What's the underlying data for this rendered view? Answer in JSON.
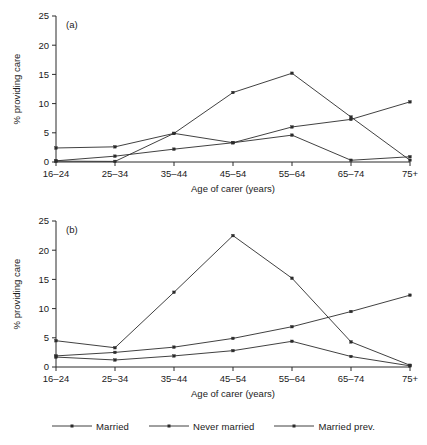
{
  "figure": {
    "panels": [
      "(a)",
      "(b)"
    ],
    "xlabel": "Age of carer (years)",
    "ylabel": "% providing care",
    "categories": [
      "16–24",
      "25–34",
      "35–44",
      "45–54",
      "55–64",
      "65–74",
      "75+"
    ],
    "yticks": [
      "0",
      "5",
      "10",
      "15",
      "20",
      "25"
    ]
  },
  "legend": {
    "position": "bottom-center",
    "items": [
      {
        "label": "Married",
        "marker": "line-with-dot-marker"
      },
      {
        "label": "Never married",
        "marker": "line-with-dot-marker"
      },
      {
        "label": "Married prev.",
        "marker": "line-with-dot-marker"
      }
    ]
  },
  "chart_data": [
    {
      "type": "line",
      "title": "(a)",
      "xlabel": "Age of carer (years)",
      "ylabel": "% providing care",
      "categories": [
        "16–24",
        "25–34",
        "35–44",
        "45–54",
        "55–64",
        "65–74",
        "75+"
      ],
      "ylim": [
        0,
        25
      ],
      "yticks": [
        0,
        5,
        10,
        15,
        20,
        25
      ],
      "grid": false,
      "legend_position": "bottom-center",
      "series": [
        {
          "name": "Married",
          "values": [
            0.2,
            1.0,
            2.2,
            3.3,
            6.0,
            7.3,
            10.3
          ]
        },
        {
          "name": "Never married",
          "values": [
            2.4,
            2.6,
            4.9,
            3.3,
            4.6,
            0.3,
            0.9
          ]
        },
        {
          "name": "Married prev.",
          "values": [
            0.15,
            0.1,
            4.9,
            11.9,
            15.2,
            7.7,
            0.3
          ]
        }
      ]
    },
    {
      "type": "line",
      "title": "(b)",
      "xlabel": "Age of carer (years)",
      "ylabel": "% providing care",
      "categories": [
        "16–24",
        "25–34",
        "35–44",
        "45–54",
        "55–64",
        "65–74",
        "75+"
      ],
      "ylim": [
        0,
        25
      ],
      "yticks": [
        0,
        5,
        10,
        15,
        20,
        25
      ],
      "grid": false,
      "legend_position": "bottom-center",
      "series": [
        {
          "name": "Married",
          "values": [
            1.7,
            1.2,
            1.9,
            2.8,
            4.4,
            1.8,
            0.2
          ]
        },
        {
          "name": "Never married",
          "values": [
            1.9,
            2.5,
            3.4,
            4.9,
            6.9,
            9.5,
            12.3
          ]
        },
        {
          "name": "Married prev.",
          "values": [
            4.5,
            3.3,
            12.8,
            22.5,
            15.2,
            4.3,
            0.3
          ]
        }
      ]
    }
  ]
}
